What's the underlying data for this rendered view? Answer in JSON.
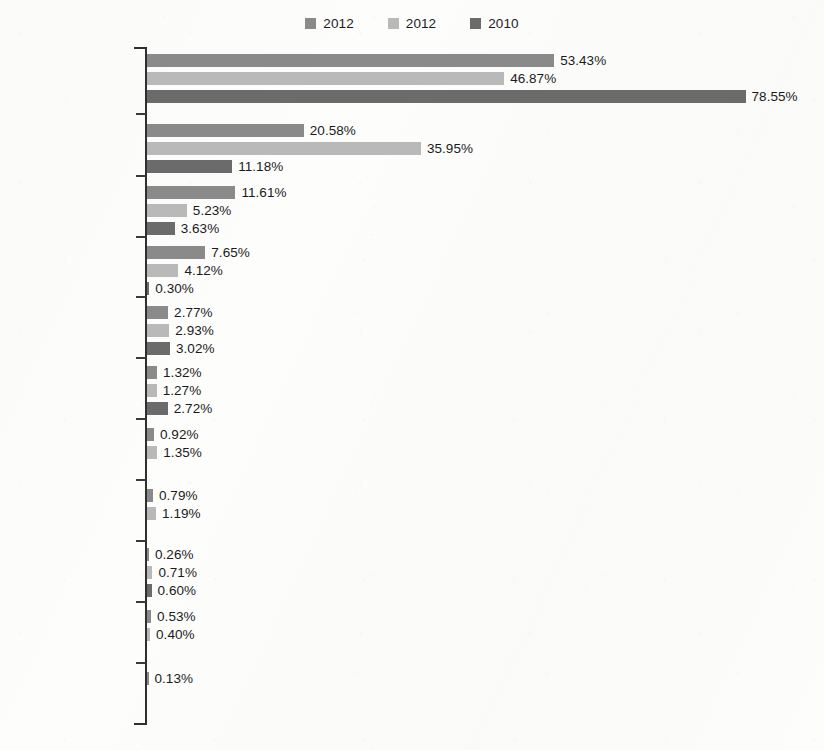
{
  "legend": {
    "position": "top-center",
    "items": [
      {
        "label": "2012",
        "color": "#8a8a8a"
      },
      {
        "label": "2012",
        "color": "#b9b9b9"
      },
      {
        "label": "2010",
        "color": "#6b6b6b"
      }
    ]
  },
  "chart_data": {
    "type": "bar",
    "orientation": "horizontal",
    "title": "",
    "xlabel": "",
    "ylabel": "",
    "grid": false,
    "legend_position": "top-center",
    "value_suffix": "%",
    "xlim": [
      0,
      78.55
    ],
    "categories": [
      "Judicial action",
      "Violent repression",
      "Administrative sanctions",
      "Mobilize military",
      "Coercion (unspecified)",
      "Deportation",
      "Mobilize police",
      "Increase military alert",
      "Increase police alert",
      "Show military or police force",
      "Seizing property"
    ],
    "category_lines": [
      [
        "Judicial action"
      ],
      [
        "Violent",
        "repression"
      ],
      [
        "Administrative",
        "sanctions"
      ],
      [
        "Mobilize military"
      ],
      [
        "Coercion",
        "(unspecified)"
      ],
      [
        "Deportation"
      ],
      [
        "Mobilize police"
      ],
      [
        "Increase",
        "military alert"
      ],
      [
        "Increase",
        "police alert"
      ],
      [
        "Show military or",
        "police force"
      ],
      [
        "Seizing property"
      ]
    ],
    "series": [
      {
        "name": "2012",
        "color": "#8a8a8a",
        "values": [
          53.43,
          20.58,
          11.61,
          7.65,
          2.77,
          1.32,
          0.92,
          0.79,
          0.26,
          0.53,
          0.13
        ],
        "labels": [
          "53.43%",
          "20.58%",
          "11.61%",
          "7.65%",
          "2.77%",
          "1.32%",
          "0.92%",
          "0.79%",
          "0.26%",
          "0.53%",
          "0.13%"
        ]
      },
      {
        "name": "2012",
        "color": "#b9b9b9",
        "values": [
          46.87,
          35.95,
          5.23,
          4.12,
          2.93,
          1.27,
          1.35,
          1.19,
          0.71,
          0.4,
          null
        ],
        "labels": [
          "46.87%",
          "35.95%",
          "5.23%",
          "4.12%",
          "2.93%",
          "1.27%",
          "1.35%",
          "1.19%",
          "0.71%",
          "0.40%",
          null
        ]
      },
      {
        "name": "2010",
        "color": "#6b6b6b",
        "values": [
          78.55,
          11.18,
          3.63,
          0.3,
          3.02,
          2.72,
          null,
          null,
          0.6,
          null,
          null
        ],
        "labels": [
          "78.55%",
          "11.18%",
          "3.63%",
          "0.30%",
          "3.02%",
          "2.72%",
          null,
          null,
          "0.60%",
          null,
          null
        ]
      }
    ]
  },
  "layout": {
    "px_per_percent": 7.62,
    "group_tops": [
      54,
      124,
      186,
      246,
      306,
      366,
      428,
      489,
      548,
      610,
      672
    ],
    "tick_ys": [
      47,
      113,
      175,
      236,
      296,
      357,
      418,
      479,
      540,
      601,
      662,
      723
    ],
    "label_tops": [
      64,
      126,
      188,
      255,
      318,
      375,
      437,
      498,
      557,
      619,
      682
    ]
  }
}
